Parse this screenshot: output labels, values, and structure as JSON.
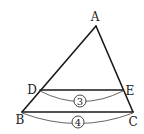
{
  "diagram": {
    "type": "triangle-parallel-segment",
    "points": {
      "A": {
        "label": "A",
        "x": 96,
        "y": 26
      },
      "B": {
        "label": "B",
        "x": 22,
        "y": 112
      },
      "C": {
        "label": "C",
        "x": 133,
        "y": 112
      },
      "D": {
        "label": "D",
        "x": 40,
        "y": 90
      },
      "E": {
        "label": "E",
        "x": 123,
        "y": 90
      }
    },
    "segments": [
      {
        "from": "A",
        "to": "B"
      },
      {
        "from": "A",
        "to": "C"
      },
      {
        "from": "B",
        "to": "C"
      },
      {
        "from": "D",
        "to": "E"
      }
    ],
    "measures": {
      "DE": {
        "label": "3",
        "shape": "circled"
      },
      "BC": {
        "label": "4",
        "shape": "circled"
      }
    },
    "colors": {
      "line": "#1a1a1a",
      "arc": "#555555",
      "text": "#222222",
      "background": "#ffffff"
    }
  }
}
